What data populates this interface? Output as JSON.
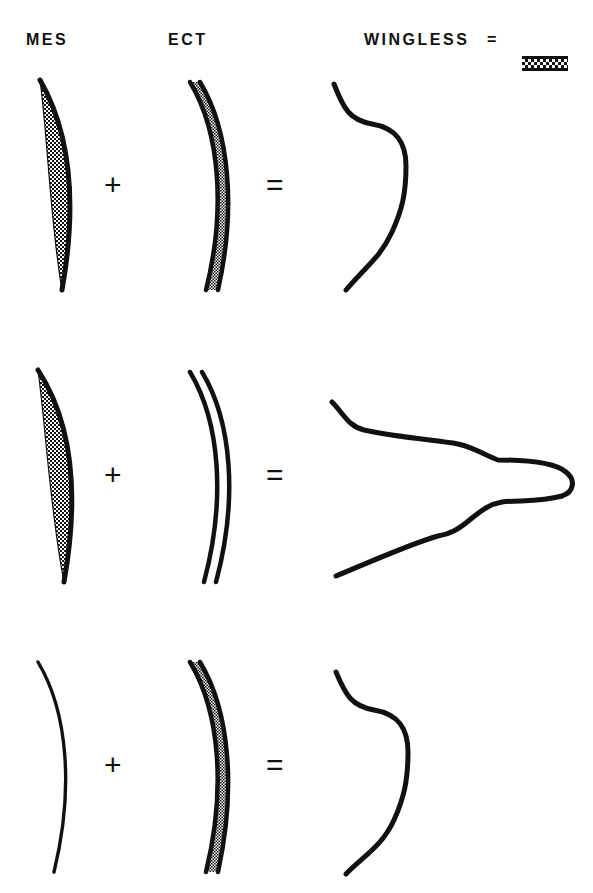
{
  "figure": {
    "background_color": "#ffffff",
    "ink_color": "#111111",
    "width": 593,
    "height": 893
  },
  "header": {
    "mes_label": "MES",
    "ect_label": "ECT",
    "wingless_label": "WINGLESS",
    "equals_label": "=",
    "legend_swatch_name": "wingless-tissue-pattern",
    "legend_swatch_description": "stippled band bounded by two solid dark lines"
  },
  "operators": {
    "plus": "+",
    "equals": "="
  },
  "rows": [
    {
      "id": "row-1",
      "mes": {
        "name": "mesoderm-wingless",
        "shape": "stippled-lens",
        "genotype": "wingless",
        "filled": true
      },
      "ect": {
        "name": "ectoderm-wingless",
        "shape": "stippled-band",
        "genotype": "wingless",
        "filled": true
      },
      "result": {
        "name": "result-wingless",
        "shape": "wavy-flank-outline",
        "outcome": "wingless"
      }
    },
    {
      "id": "row-2",
      "mes": {
        "name": "mesoderm-wingless",
        "shape": "stippled-lens",
        "genotype": "wingless",
        "filled": true
      },
      "ect": {
        "name": "ectoderm-normal",
        "shape": "open-band",
        "genotype": "normal",
        "filled": false
      },
      "result": {
        "name": "result-wing-outgrowth",
        "shape": "wing-bud-outline",
        "outcome": "wing outgrowth"
      }
    },
    {
      "id": "row-3",
      "mes": {
        "name": "mesoderm-absent",
        "shape": "single-line",
        "genotype": "normal",
        "filled": false
      },
      "ect": {
        "name": "ectoderm-wingless",
        "shape": "stippled-band",
        "genotype": "wingless",
        "filled": true
      },
      "result": {
        "name": "result-wingless",
        "shape": "wavy-flank-outline",
        "outcome": "wingless"
      }
    }
  ]
}
